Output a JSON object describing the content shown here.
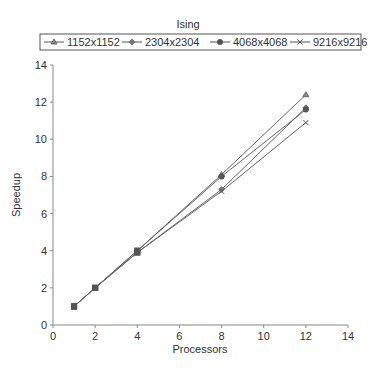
{
  "chart_data": {
    "type": "line",
    "title": "Ising",
    "xlabel": "Processors",
    "ylabel": "Speedup",
    "xlim": [
      0,
      14
    ],
    "ylim": [
      0,
      14
    ],
    "xticks": [
      0,
      2,
      4,
      6,
      8,
      10,
      12,
      14
    ],
    "yticks": [
      0,
      2,
      4,
      6,
      8,
      10,
      12,
      14
    ],
    "grid": false,
    "legend_position": "top",
    "x": [
      1,
      2,
      4,
      8,
      12
    ],
    "series": [
      {
        "name": "1152x1152",
        "marker": "triangle",
        "values": [
          1,
          2,
          4,
          8.1,
          12.4
        ]
      },
      {
        "name": "2304x2304",
        "marker": "diamond",
        "values": [
          1,
          2,
          3.9,
          7.3,
          11.7
        ]
      },
      {
        "name": "4068x4068",
        "marker": "circle",
        "values": [
          1,
          2,
          4,
          8.0,
          11.6
        ]
      },
      {
        "name": "9216x9216",
        "marker": "x",
        "values": [
          1,
          2,
          3.9,
          7.2,
          10.9
        ]
      }
    ]
  }
}
